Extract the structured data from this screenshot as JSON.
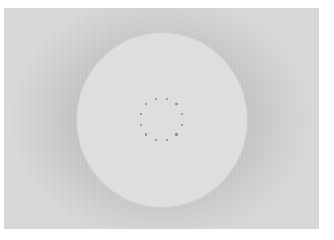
{
  "figure": {
    "frame": {
      "x": 4,
      "y": 8,
      "width": 315,
      "height": 221,
      "color_center": "#c2c2c2",
      "color_edge": "#d8d8d8"
    },
    "disc": {
      "cx": 161.5,
      "cy": 119.5,
      "rx": 85,
      "ry": 87,
      "color": "#dedede"
    },
    "dot_ring": {
      "cx": 161.3,
      "cy": 119.3,
      "radius": 21.3,
      "count": 12,
      "start_angle_deg": 15,
      "dot_diameter": 2.4,
      "color": "#8a8a8a"
    }
  }
}
